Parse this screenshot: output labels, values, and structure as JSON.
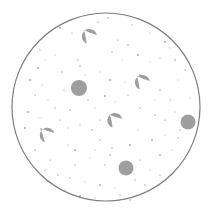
{
  "diagram": {
    "width": 208,
    "height": 215,
    "background": "#ffffff",
    "boundary": {
      "cx": 106,
      "cy": 107,
      "r": 94,
      "stroke": "#7d7d7d",
      "stroke_width": 1.2,
      "fill": "#ffffff"
    },
    "shape_fill": "#9e9e9e",
    "speckle_color": "#555555",
    "round_particles": [
      {
        "cx": 79,
        "cy": 88,
        "r": 8
      },
      {
        "cx": 188,
        "cy": 122,
        "r": 7.5
      },
      {
        "cx": 126,
        "cy": 168,
        "r": 7.5
      }
    ],
    "teardrop_particles": [
      {
        "cx": 94,
        "cy": 42,
        "r": 7.5,
        "tip_x": 84,
        "tip_y": 30
      },
      {
        "cx": 147,
        "cy": 88,
        "r": 7.5,
        "tip_x": 137,
        "tip_y": 76
      },
      {
        "cx": 120,
        "cy": 126,
        "r": 7.5,
        "tip_x": 110,
        "tip_y": 115
      },
      {
        "cx": 52,
        "cy": 140,
        "r": 7.5,
        "tip_x": 40,
        "tip_y": 128
      }
    ],
    "speckles": [
      [
        60,
        28
      ],
      [
        72,
        33
      ],
      [
        98,
        22
      ],
      [
        108,
        18
      ],
      [
        132,
        25
      ],
      [
        150,
        33
      ],
      [
        165,
        42
      ],
      [
        170,
        48
      ],
      [
        118,
        40
      ],
      [
        128,
        45
      ],
      [
        40,
        50
      ],
      [
        45,
        60
      ],
      [
        38,
        68
      ],
      [
        55,
        55
      ],
      [
        78,
        60
      ],
      [
        80,
        66
      ],
      [
        112,
        52
      ],
      [
        122,
        60
      ],
      [
        138,
        55
      ],
      [
        150,
        62
      ],
      [
        160,
        58
      ],
      [
        175,
        60
      ],
      [
        185,
        70
      ],
      [
        178,
        80
      ],
      [
        30,
        80
      ],
      [
        42,
        85
      ],
      [
        35,
        95
      ],
      [
        62,
        72
      ],
      [
        64,
        90
      ],
      [
        100,
        72
      ],
      [
        110,
        80
      ],
      [
        125,
        82
      ],
      [
        128,
        95
      ],
      [
        160,
        90
      ],
      [
        170,
        100
      ],
      [
        190,
        98
      ],
      [
        28,
        112
      ],
      [
        40,
        118
      ],
      [
        55,
        108
      ],
      [
        70,
        110
      ],
      [
        88,
        100
      ],
      [
        95,
        108
      ],
      [
        105,
        96
      ],
      [
        115,
        102
      ],
      [
        140,
        108
      ],
      [
        155,
        115
      ],
      [
        165,
        120
      ],
      [
        175,
        112
      ],
      [
        25,
        128
      ],
      [
        68,
        128
      ],
      [
        80,
        125
      ],
      [
        92,
        130
      ],
      [
        100,
        140
      ],
      [
        138,
        130
      ],
      [
        152,
        140
      ],
      [
        165,
        135
      ],
      [
        178,
        138
      ],
      [
        35,
        150
      ],
      [
        50,
        160
      ],
      [
        68,
        145
      ],
      [
        75,
        150
      ],
      [
        90,
        158
      ],
      [
        105,
        165
      ],
      [
        110,
        155
      ],
      [
        140,
        160
      ],
      [
        150,
        170
      ],
      [
        160,
        155
      ],
      [
        172,
        150
      ],
      [
        45,
        170
      ],
      [
        58,
        175
      ],
      [
        70,
        178
      ],
      [
        85,
        182
      ],
      [
        100,
        185
      ],
      [
        115,
        188
      ],
      [
        135,
        180
      ],
      [
        145,
        185
      ],
      [
        160,
        175
      ],
      [
        65,
        190
      ],
      [
        80,
        196
      ],
      [
        95,
        198
      ],
      [
        120,
        195
      ],
      [
        130,
        200
      ],
      [
        100,
        120
      ],
      [
        85,
        75
      ],
      [
        140,
        75
      ],
      [
        48,
        100
      ],
      [
        180,
        130
      ],
      [
        112,
        148
      ],
      [
        60,
        120
      ],
      [
        155,
        100
      ],
      [
        130,
        145
      ],
      [
        95,
        150
      ],
      [
        75,
        165
      ]
    ]
  }
}
